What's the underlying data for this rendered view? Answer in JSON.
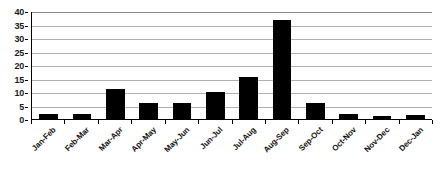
{
  "chart_data": {
    "type": "bar",
    "title": "",
    "subtitle": "",
    "xlabel": "",
    "ylabel": "",
    "categories": [
      "Jan-Feb",
      "Feb-Mar",
      "Mar-Apr",
      "Apr-May",
      "May-Jun",
      "Jun-Jul",
      "Jul-Aug",
      "Aug-Sep",
      "Sep-Oct",
      "Oct-Nov",
      "Nov-Dec",
      "Dec-Jan"
    ],
    "values": [
      2,
      2,
      11,
      6,
      6,
      10,
      15.5,
      36.5,
      6,
      2,
      1,
      1.5
    ],
    "ylim": [
      0,
      40
    ],
    "ytick_labels": [
      "0",
      "5",
      "10",
      "15",
      "20",
      "25",
      "30",
      "35",
      "40"
    ],
    "ytick_values": [
      0,
      5,
      10,
      15,
      20,
      25,
      30,
      35,
      40
    ],
    "grid": true,
    "grid_axis": "y",
    "legend": false,
    "legend_position": "none",
    "series": [
      {
        "name": "",
        "color": "#000000",
        "values": [
          2,
          2,
          11,
          6,
          6,
          10,
          15.5,
          36.5,
          6,
          2,
          1,
          1.5
        ]
      }
    ],
    "colors": {
      "bar": "#000000",
      "gridline": "#b0b0b0",
      "axis": "#000000",
      "background": "#ffffff",
      "text": "#111111"
    }
  }
}
